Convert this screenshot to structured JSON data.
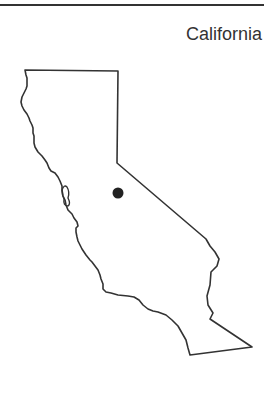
{
  "map": {
    "title": "California",
    "region": "California state outline",
    "marker": {
      "label": "location-dot",
      "x": 118,
      "y": 193,
      "r": 5,
      "color": "#222222"
    },
    "outline_color": "#333333"
  }
}
